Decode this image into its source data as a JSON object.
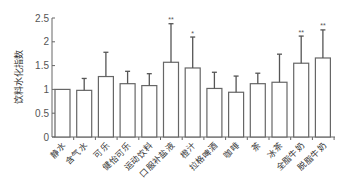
{
  "chart_data": {
    "type": "bar",
    "title": "",
    "xlabel": "",
    "ylabel": "饮料水化指数",
    "ylim": [
      0,
      2.5
    ],
    "yticks": [
      0,
      0.5,
      1,
      1.5,
      2,
      2.5
    ],
    "ytick_labels": [
      "0",
      "0.5",
      "1",
      "1.5",
      "2",
      "2.5"
    ],
    "grid": false,
    "legend": "none",
    "categories": [
      "静水",
      "含气水",
      "可乐",
      "健怡可乐",
      "运动饮料",
      "口服补盐液",
      "橙汁",
      "拉格啤酒",
      "咖啡",
      "茶",
      "冰茶",
      "全脂牛奶",
      "脱脂牛奶"
    ],
    "values": [
      1.0,
      0.98,
      1.27,
      1.12,
      1.08,
      1.57,
      1.45,
      1.02,
      0.94,
      1.12,
      1.15,
      1.55,
      1.66
    ],
    "error_upper": [
      null,
      1.23,
      1.78,
      1.38,
      1.33,
      2.38,
      2.1,
      1.36,
      1.28,
      1.34,
      1.74,
      2.12,
      2.25
    ],
    "significance": [
      "",
      "",
      "",
      "",
      "",
      "**",
      "*",
      "",
      "",
      "",
      "",
      "**",
      "**"
    ]
  }
}
